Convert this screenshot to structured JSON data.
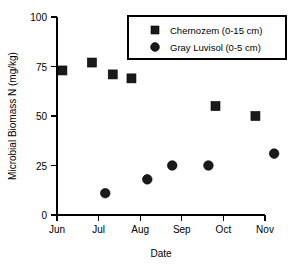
{
  "chart_data": {
    "type": "scatter",
    "title": "",
    "xlabel": "Date",
    "ylabel": "Microbial Biomass N (mg/kg)",
    "xticklabels": [
      "Jun",
      "Jul",
      "Aug",
      "Sep",
      "Oct",
      "Nov"
    ],
    "yticklabels": [
      "0",
      "25",
      "50",
      "75",
      "100"
    ],
    "yticks": [
      0,
      25,
      50,
      75,
      100
    ],
    "ylim": [
      0,
      100
    ],
    "xlim": [
      "Jun",
      "Nov"
    ],
    "grid": false,
    "legend_position": "top-right",
    "series": [
      {
        "name": "Chernozem (0-15 cm)",
        "marker": "square",
        "color": "#1a1a1a",
        "x": [
          "Jun 5",
          "Jun 25",
          "Jul 10",
          "Jul 22",
          "Sep 10",
          "Oct 15"
        ],
        "x_numeric": [
          0.13,
          0.84,
          1.34,
          1.79,
          3.81,
          4.77
        ],
        "values": [
          73,
          77,
          71,
          69,
          55,
          50
        ]
      },
      {
        "name": "Gray Luvisol (0-5 cm)",
        "marker": "circle",
        "color": "#1a1a1a",
        "x": [
          "Jul 16",
          "Aug 6",
          "Aug 21",
          "Sep 6",
          "Oct 26"
        ],
        "x_numeric": [
          1.16,
          2.17,
          2.77,
          3.64,
          5.22
        ],
        "values": [
          11,
          18,
          25,
          25,
          31
        ]
      }
    ]
  },
  "legend": {
    "entries": [
      {
        "label": "Chernozem (0-15 cm)",
        "marker": "square"
      },
      {
        "label": "Gray Luvisol (0-5 cm)",
        "marker": "circle"
      }
    ]
  },
  "axes": {
    "y_title": "Microbial Biomass N (mg/kg)",
    "x_title": "Date",
    "y_tick_0": "0",
    "y_tick_25": "25",
    "y_tick_50": "50",
    "y_tick_75": "75",
    "y_tick_100": "100",
    "x_tick_jun": "Jun",
    "x_tick_jul": "Jul",
    "x_tick_aug": "Aug",
    "x_tick_sep": "Sep",
    "x_tick_oct": "Oct",
    "x_tick_nov": "Nov"
  }
}
